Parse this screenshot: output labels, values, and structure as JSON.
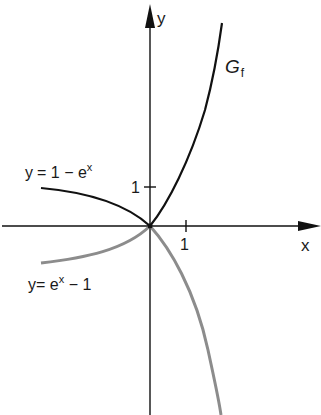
{
  "diagram": {
    "axes": {
      "x_label": "x",
      "y_label": "y",
      "x_tick_label": "1",
      "y_tick_label": "1"
    },
    "curves": [
      {
        "id": "gf",
        "label_main": "G",
        "label_sub": "f",
        "color": "#111111",
        "description": "graph of f: 1 - e^x for x<0, e^x - 1 for x>0"
      },
      {
        "id": "neg-branch",
        "label": "y = 1 − eˣ",
        "label_y": "y",
        "label_eq": "= 1 − e",
        "label_sup": "x",
        "color": "#111111"
      },
      {
        "id": "pos-branch",
        "label": "y = eˣ − 1",
        "label_y": "y",
        "label_eq": "= e",
        "label_sup": "x",
        "label_tail": " − 1",
        "color": "#8c8c8c"
      }
    ],
    "colors": {
      "axis": "#111111",
      "primary_curve": "#111111",
      "secondary_curve": "#8c8c8c",
      "background": "#ffffff"
    }
  }
}
